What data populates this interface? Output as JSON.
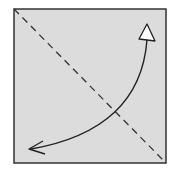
{
  "diagram": {
    "type": "origami-fold-step",
    "paper": {
      "x": 14,
      "y": 9,
      "width": 152,
      "height": 154,
      "fill": "#dcdcdc",
      "stroke": "#333333"
    },
    "fold_line": {
      "style": "valley-dashed",
      "x1": 14,
      "y1": 9,
      "x2": 166,
      "y2": 163,
      "color": "#333333"
    },
    "fold_arrow": {
      "from": "bottom-left",
      "to": "top-right",
      "path": "M 147 40 Q 140 130 31 149",
      "color": "#222222"
    }
  }
}
